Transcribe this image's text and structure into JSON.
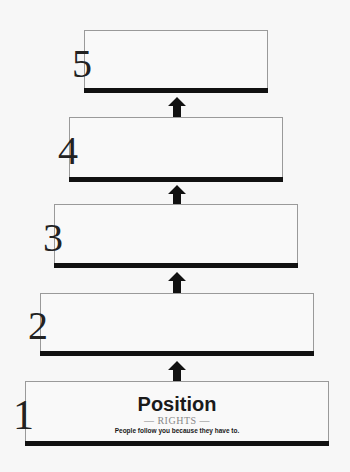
{
  "diagram": {
    "levels": [
      {
        "number": "5",
        "title": "",
        "subtitle": "",
        "description": ""
      },
      {
        "number": "4",
        "title": "",
        "subtitle": "",
        "description": ""
      },
      {
        "number": "3",
        "title": "",
        "subtitle": "",
        "description": ""
      },
      {
        "number": "2",
        "title": "",
        "subtitle": "",
        "description": ""
      },
      {
        "number": "1",
        "title": "Position",
        "subtitle": "— RIGHTS —",
        "description": "People follow you because they have to."
      }
    ],
    "arrow_icon": "up-arrow-icon",
    "colors": {
      "bar": "#111111",
      "border": "#9a9a9a",
      "background": "#f7f7f7"
    }
  }
}
